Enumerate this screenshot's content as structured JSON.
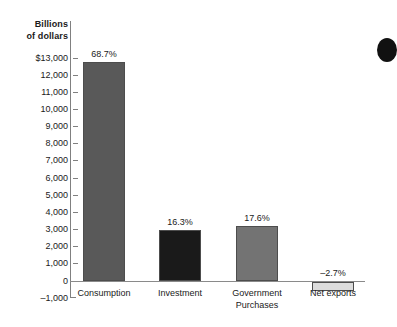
{
  "chart_data": {
    "type": "bar",
    "title": "",
    "subtitle": "",
    "xlabel": "",
    "ylabel": "Billions\nof dollars",
    "ylabel_lines": [
      "Billions",
      "of dollars"
    ],
    "categories": [
      "Consumption",
      "Investment",
      "Government Purchases",
      "Net exports"
    ],
    "category_label_lines": [
      [
        "Consumption"
      ],
      [
        "Investment"
      ],
      [
        "Government",
        "Purchases"
      ],
      [
        "Net exports"
      ]
    ],
    "values": [
      12750,
      2990,
      3200,
      -500
    ],
    "data_labels": [
      "68.7%",
      "16.3%",
      "17.6%",
      "–2.7%"
    ],
    "share_percent": [
      68.7,
      16.3,
      17.6,
      -2.7
    ],
    "bar_colors": [
      "#595959",
      "#1a1a1a",
      "#737373",
      "#dcdcdc"
    ],
    "ylim": [
      -1000,
      13000
    ],
    "ytick_values": [
      13000,
      12000,
      11000,
      10000,
      9000,
      8000,
      7000,
      6000,
      5000,
      4000,
      3000,
      2000,
      1000,
      0,
      -1000
    ],
    "ytick_labels": [
      "$13,000",
      "12,000",
      "11,000",
      "10,000",
      "9,000",
      "8,000",
      "7,000",
      "6,000",
      "5,000",
      "4,000",
      "3,000",
      "2,000",
      "1,000",
      "0",
      "–1,000"
    ],
    "grid": false,
    "legend": "none",
    "axis_color": "#808080"
  }
}
